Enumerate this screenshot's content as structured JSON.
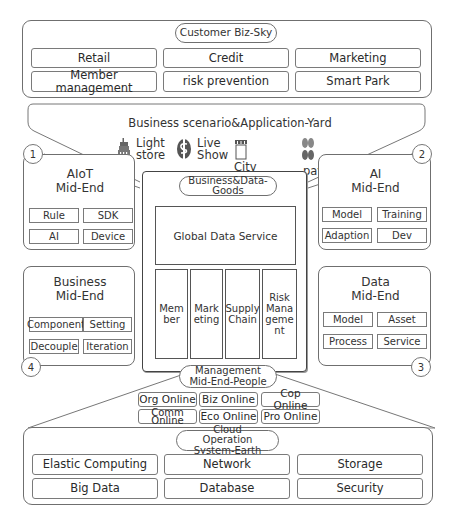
{
  "sky": {
    "title": "Customer Biz-Sky",
    "items": [
      "Retail",
      "Credit",
      "Marketing",
      "Member management",
      "risk prevention",
      "Smart Park"
    ]
  },
  "yard": {
    "title": "Business scenario&Application-Yard",
    "apps": [
      {
        "icon": "building-icon",
        "label_line1": "Light",
        "label_line2": "store"
      },
      {
        "icon": "globe-dollar-icon",
        "label_line1": "Live",
        "label_line2": "Show"
      },
      {
        "icon": "storefront-icon",
        "label_line1": "City",
        "label_line2": "Shopping"
      },
      {
        "icon": "payment-icon",
        "label_line1": "payment",
        "label_line2": ""
      }
    ]
  },
  "numbers": [
    "1",
    "2",
    "3",
    "4"
  ],
  "aiot": {
    "title_line1": "AIoT",
    "title_line2": "Mid-End",
    "items": [
      "Rule",
      "SDK",
      "AI",
      "Device"
    ]
  },
  "ai": {
    "title_line1": "AI",
    "title_line2": "Mid-End",
    "items": [
      "Model",
      "Training",
      "Adaption",
      "Dev"
    ]
  },
  "business": {
    "title_line1": "Business",
    "title_line2": "Mid-End",
    "items": [
      "Component",
      "Setting",
      "Decouple",
      "Iteration"
    ]
  },
  "data_mid": {
    "title_line1": "Data",
    "title_line2": "Mid-End",
    "items": [
      "Model",
      "Asset",
      "Process",
      "Service"
    ]
  },
  "goods": {
    "title": "Business&Data-Goods",
    "global": "Global Data Service",
    "columns": [
      "Member",
      "Marketing",
      "Supply Chain",
      "Risk Management"
    ]
  },
  "management": {
    "title": "Management Mid-End-People",
    "items": [
      "Org Online",
      "Biz Online",
      "Cop Online",
      "Comm Online",
      "Eco Online",
      "Pro Online"
    ]
  },
  "earth": {
    "title": "Cloud Operation System-Earth",
    "items": [
      "Elastic Computing",
      "Network",
      "Storage",
      "Big Data",
      "Database",
      "Security"
    ]
  }
}
